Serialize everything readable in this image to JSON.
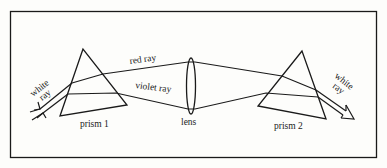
{
  "diagram": {
    "labels": {
      "white_ray_in": [
        "white",
        "ray"
      ],
      "red_ray": "red ray",
      "violet_ray": "violet ray",
      "prism_1": "prism 1",
      "lens": "lens",
      "prism_2": "prism 2",
      "white_ray_out": [
        "white",
        "ray"
      ]
    },
    "colors": {
      "stroke": "#1a1a1a",
      "background": "#fdfdfb",
      "text": "#222222"
    }
  }
}
